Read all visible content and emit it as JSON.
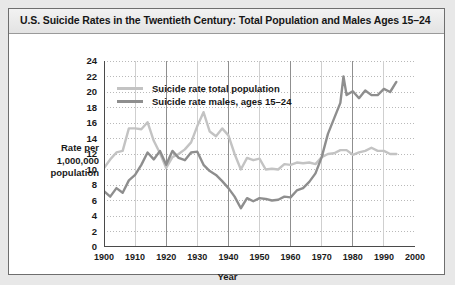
{
  "chart_title": "U.S. Suicide Rates in the Twentieth Century: Total Population and Males Ages 15–24",
  "axis": {
    "ytitle_line1": "Rate per",
    "ytitle_line2": "1,000,000",
    "ytitle_line3": "population",
    "xtitle": "Year"
  },
  "legend": {
    "items": [
      {
        "label": "Suicide rate total population",
        "color": "#c3c3c3"
      },
      {
        "label": "Suicide rate males, ages 15–24",
        "color": "#8e8e8e"
      }
    ]
  },
  "colors": {
    "total_population": "#c3c3c3",
    "males_15_24": "#8e8e8e",
    "axis": "#4a4a4a",
    "gridline": "#b9b9b9",
    "frame": "#6e6e6e",
    "title_text": "#161616",
    "page_background": "#e8e8e8",
    "panel_background": "#ffffff"
  },
  "chart_data": {
    "type": "line",
    "title": "U.S. Suicide Rates in the Twentieth Century: Total Population and Males Ages 15–24",
    "xlabel": "Year",
    "ylabel": "Rate per 1,000,000 population",
    "xlim": [
      1900,
      2000
    ],
    "ylim": [
      0,
      24
    ],
    "ytick_step": 2,
    "xtick_step": 10,
    "yticks": [
      0,
      2,
      4,
      6,
      8,
      10,
      12,
      14,
      16,
      18,
      20,
      22,
      24
    ],
    "xticks": [
      1900,
      1910,
      1920,
      1930,
      1940,
      1950,
      1960,
      1970,
      1980,
      1990,
      2000
    ],
    "grid": true,
    "legend_position": "upper-left-inside",
    "series": [
      {
        "name": "Suicide rate total population",
        "color": "#c3c3c3",
        "x": [
          1900,
          1902,
          1904,
          1906,
          1908,
          1910,
          1912,
          1914,
          1916,
          1918,
          1920,
          1922,
          1924,
          1926,
          1928,
          1930,
          1932,
          1934,
          1936,
          1938,
          1940,
          1942,
          1944,
          1946,
          1948,
          1950,
          1952,
          1954,
          1956,
          1958,
          1960,
          1962,
          1964,
          1966,
          1968,
          1970,
          1972,
          1974,
          1976,
          1978,
          1980,
          1982,
          1984,
          1986,
          1988,
          1990,
          1992,
          1994
        ],
        "y": [
          10.2,
          11.3,
          12.2,
          12.4,
          15.3,
          15.3,
          15.2,
          16.1,
          13.7,
          12.1,
          10.2,
          11.6,
          12.0,
          12.6,
          13.5,
          15.6,
          17.4,
          14.9,
          14.3,
          15.3,
          14.4,
          12.0,
          10.0,
          11.5,
          11.2,
          11.4,
          10.0,
          10.1,
          10.0,
          10.7,
          10.6,
          10.9,
          10.8,
          10.9,
          10.7,
          11.6,
          12.0,
          12.1,
          12.5,
          12.5,
          11.9,
          12.2,
          12.4,
          12.8,
          12.4,
          12.4,
          12.0,
          12.0
        ]
      },
      {
        "name": "Suicide rate males, ages 15–24",
        "color": "#8e8e8e",
        "x": [
          1900,
          1902,
          1904,
          1906,
          1908,
          1910,
          1912,
          1914,
          1916,
          1918,
          1920,
          1922,
          1924,
          1926,
          1928,
          1930,
          1932,
          1934,
          1936,
          1938,
          1940,
          1942,
          1944,
          1946,
          1948,
          1950,
          1952,
          1954,
          1956,
          1958,
          1960,
          1962,
          1964,
          1966,
          1968,
          1970,
          1972,
          1974,
          1976,
          1977,
          1978,
          1980,
          1982,
          1984,
          1986,
          1988,
          1990,
          1992,
          1994
        ],
        "y": [
          7.2,
          6.5,
          7.6,
          7.0,
          8.6,
          9.3,
          10.6,
          12.2,
          11.3,
          12.4,
          10.6,
          12.4,
          11.5,
          11.2,
          12.2,
          12.3,
          10.6,
          9.8,
          9.3,
          8.5,
          7.6,
          6.5,
          5.0,
          6.3,
          5.9,
          6.3,
          6.2,
          6.0,
          6.1,
          6.5,
          6.4,
          7.3,
          7.6,
          8.4,
          9.5,
          11.6,
          14.6,
          16.6,
          18.6,
          22.0,
          19.6,
          20.1,
          19.2,
          20.2,
          19.6,
          19.6,
          20.4,
          20.0,
          21.3
        ]
      }
    ]
  }
}
